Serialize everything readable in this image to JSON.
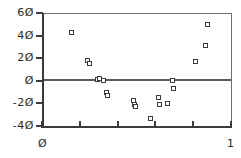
{
  "chart_data": {
    "type": "scatter",
    "title": "",
    "xlabel": "",
    "ylabel": "",
    "xlim": [
      0,
      1
    ],
    "ylim": [
      -40,
      60
    ],
    "grid": false,
    "legend": null,
    "y_ticks": [
      {
        "value": 60,
        "label": "6Ø"
      },
      {
        "value": 40,
        "label": "4Ø"
      },
      {
        "value": 20,
        "label": "2Ø"
      },
      {
        "value": 0,
        "label": "Ø"
      },
      {
        "value": -20,
        "label": "-2Ø"
      },
      {
        "value": -40,
        "label": "-4Ø"
      }
    ],
    "x_ticks": [
      {
        "value": 0.0,
        "label": "Ø"
      },
      {
        "value": 0.2,
        "label": ""
      },
      {
        "value": 0.4,
        "label": ""
      },
      {
        "value": 0.6,
        "label": ""
      },
      {
        "value": 0.8,
        "label": ""
      },
      {
        "value": 1.0,
        "label": "1"
      }
    ],
    "reference_lines": [
      {
        "orientation": "horizontal",
        "value": 0,
        "color": "#5a5a5a"
      }
    ],
    "marker_style": "open-square",
    "marker_color": "#3a3a3a",
    "points": [
      {
        "x": 0.158,
        "y": 43
      },
      {
        "x": 0.242,
        "y": 18
      },
      {
        "x": 0.253,
        "y": 15
      },
      {
        "x": 0.295,
        "y": 1
      },
      {
        "x": 0.305,
        "y": 2
      },
      {
        "x": 0.326,
        "y": 0
      },
      {
        "x": 0.342,
        "y": -10
      },
      {
        "x": 0.347,
        "y": -13
      },
      {
        "x": 0.484,
        "y": -17
      },
      {
        "x": 0.489,
        "y": -21
      },
      {
        "x": 0.495,
        "y": -23
      },
      {
        "x": 0.574,
        "y": -33
      },
      {
        "x": 0.616,
        "y": -15
      },
      {
        "x": 0.621,
        "y": -21
      },
      {
        "x": 0.663,
        "y": -20
      },
      {
        "x": 0.689,
        "y": 0
      },
      {
        "x": 0.695,
        "y": -7
      },
      {
        "x": 0.811,
        "y": 17
      },
      {
        "x": 0.863,
        "y": 31
      },
      {
        "x": 0.874,
        "y": 50
      }
    ]
  }
}
